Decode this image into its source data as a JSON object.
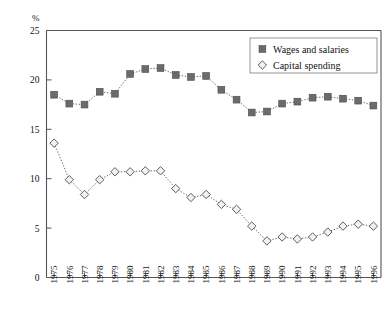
{
  "chart_data": {
    "type": "line",
    "title": "",
    "xlabel": "",
    "ylabel": "%",
    "ylim": [
      0,
      25
    ],
    "yticks": [
      0,
      5,
      10,
      15,
      20,
      25
    ],
    "grid": false,
    "legend_position": "top-right",
    "categories": [
      "1975",
      "1976",
      "1977",
      "1978",
      "1979",
      "1980",
      "1981",
      "1982",
      "1983",
      "1984",
      "1985",
      "1986",
      "1987",
      "1988",
      "1989",
      "1990",
      "1991",
      "1992",
      "1993",
      "1994",
      "1995",
      "1996"
    ],
    "series": [
      {
        "name": "Wages and salaries",
        "marker": "filled-square",
        "values": [
          18.5,
          17.6,
          17.5,
          18.8,
          18.6,
          20.6,
          21.1,
          21.2,
          20.5,
          20.3,
          20.4,
          19.0,
          18.0,
          16.7,
          16.8,
          17.6,
          17.8,
          18.2,
          18.3,
          18.1,
          17.9,
          17.4
        ]
      },
      {
        "name": "Capital spending",
        "marker": "open-diamond",
        "values": [
          13.6,
          9.9,
          8.4,
          9.9,
          10.7,
          10.7,
          10.8,
          10.8,
          9.0,
          8.1,
          8.4,
          7.4,
          6.9,
          5.2,
          3.7,
          4.1,
          3.9,
          4.1,
          4.6,
          5.2,
          5.4,
          5.2
        ]
      }
    ]
  },
  "legend": {
    "items": [
      {
        "label": "Wages and salaries",
        "marker": "filled-square"
      },
      {
        "label": "Capital spending",
        "marker": "open-diamond"
      }
    ]
  },
  "colors": {
    "wages_marker": "#6b6b6b",
    "capital_marker": "#f2f2f2",
    "axis": "#55555a",
    "line": "#6d6d6d",
    "text": "#111111",
    "background": "#ffffff"
  }
}
